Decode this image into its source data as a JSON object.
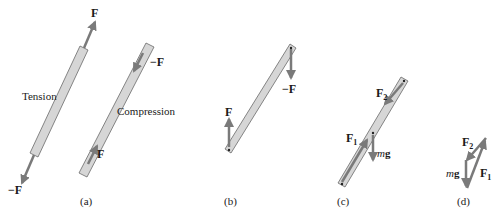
{
  "colors": {
    "rod_fill": "#d6d6d6",
    "rod_stroke": "#6a6a6a",
    "arrow": "#7a7a7a",
    "text": "#1a1a1a"
  },
  "panels": [
    {
      "id": "a",
      "caption": "(a)",
      "tension": {
        "label": "Tension",
        "force_top": "F",
        "force_bottom": "−F"
      },
      "compression": {
        "label": "Compression",
        "force_top": "−F",
        "force_bottom": "F"
      }
    },
    {
      "id": "b",
      "caption": "(b)",
      "force_left": "F",
      "force_right": "−F"
    },
    {
      "id": "c",
      "caption": "(c)",
      "force_1": {
        "main": "F",
        "sub": "1"
      },
      "force_2": {
        "main": "F",
        "sub": "2"
      },
      "weight": {
        "m": "m",
        "g": "g"
      }
    },
    {
      "id": "d",
      "caption": "(d)",
      "force_1": {
        "main": "F",
        "sub": "1"
      },
      "force_2": {
        "main": "F",
        "sub": "2"
      },
      "weight": {
        "m": "m",
        "g": "g"
      }
    }
  ]
}
